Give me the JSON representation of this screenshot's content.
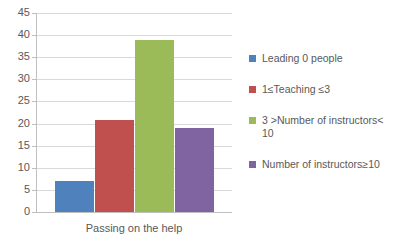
{
  "chart_data": {
    "type": "bar",
    "title": "",
    "subtitle": "",
    "xlabel": "Passing on the help",
    "ylabel": "",
    "categories": [
      "Passing on the help"
    ],
    "ylim": [
      0,
      45
    ],
    "y_ticks": [
      0,
      5,
      10,
      15,
      20,
      25,
      30,
      35,
      40,
      45
    ],
    "grid": true,
    "legend_position": "right",
    "series": [
      {
        "name": "Leading 0 people",
        "values": [
          7
        ],
        "color": "#4F81BD"
      },
      {
        "name": "1≤Teaching ≤3",
        "values": [
          20.7
        ],
        "color": "#C0504D"
      },
      {
        "name": "3 >Number of instructors< 10",
        "values": [
          39
        ],
        "color": "#9BBB59"
      },
      {
        "name": "Number of instructors≥10",
        "values": [
          19
        ],
        "color": "#8064A2"
      }
    ]
  },
  "axis": {
    "y_tick_labels": [
      "45",
      "40",
      "35",
      "30",
      "25",
      "20",
      "15",
      "10",
      "5",
      "0"
    ],
    "x_label": "Passing on the help"
  },
  "legend": {
    "items": [
      {
        "label": "Leading 0 people",
        "color": "#4F81BD"
      },
      {
        "label": "1≤Teaching ≤3",
        "color": "#C0504D"
      },
      {
        "label": "3 >Number of instructors<\n10",
        "color": "#9BBB59"
      },
      {
        "label": "Number of instructors≥10",
        "color": "#8064A2"
      }
    ]
  },
  "colors": {
    "series_1": "#4F81BD",
    "series_2": "#C0504D",
    "series_3": "#9BBB59",
    "series_4": "#8064A2",
    "gridline": "#d9d9d9",
    "axis": "#bfbfbf",
    "text": "#595959",
    "background": "#ffffff"
  }
}
